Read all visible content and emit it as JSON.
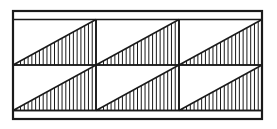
{
  "figure": {
    "canvas": {
      "width": 277,
      "height": 129,
      "background": "#ffffff"
    },
    "stroke_color": "#1a1a1a",
    "frame": {
      "name": "outer-rectangle",
      "x": 13,
      "y": 11,
      "width": 249,
      "height": 108,
      "outer_stroke_width": 2.2
    },
    "margin_strips": {
      "top_strip_line_y": 19.5,
      "bottom_strip_line_y": 110.5,
      "strip_height": 8.5,
      "stroke_width": 1.6,
      "note": "thin empty band along top and bottom inside the outer frame"
    },
    "grid": {
      "rows": 2,
      "columns": 3,
      "content_x": 13,
      "content_y": 19.5,
      "content_width": 249,
      "content_height": 91,
      "row_divider_y": 65,
      "column_divider_x": [
        96,
        179
      ],
      "divider_stroke_width": 1.6
    },
    "cells": [
      {
        "name": "cell-r1c1",
        "row": 1,
        "col": 1,
        "x": 13,
        "y": 19.5,
        "width": 83,
        "height": 45.5,
        "hatch_count": 21
      },
      {
        "name": "cell-r1c2",
        "row": 1,
        "col": 2,
        "x": 96,
        "y": 19.5,
        "width": 83,
        "height": 45.5,
        "hatch_count": 21
      },
      {
        "name": "cell-r1c3",
        "row": 1,
        "col": 3,
        "x": 179,
        "y": 19.5,
        "width": 83,
        "height": 45.5,
        "hatch_count": 21
      },
      {
        "name": "cell-r2c1",
        "row": 2,
        "col": 1,
        "x": 13,
        "y": 65,
        "width": 83,
        "height": 45.5,
        "hatch_count": 21
      },
      {
        "name": "cell-r2c2",
        "row": 2,
        "col": 2,
        "x": 96,
        "y": 65,
        "width": 83,
        "height": 45.5,
        "hatch_count": 21
      },
      {
        "name": "cell-r2c3",
        "row": 2,
        "col": 3,
        "x": 179,
        "y": 65,
        "width": 83,
        "height": 45.5,
        "hatch_count": 21
      }
    ],
    "triangle": {
      "name": "right-triangle-hatched",
      "orientation": "hypotenuse-bottom-left-to-top-right",
      "vertices_description": "bottom-left, bottom-right, top-right",
      "hypotenuse_stroke_width": 1.5,
      "hatch": {
        "direction": "vertical",
        "stroke_width": 1.0,
        "spacing": 3.8,
        "color": "#1a1a1a"
      }
    }
  }
}
